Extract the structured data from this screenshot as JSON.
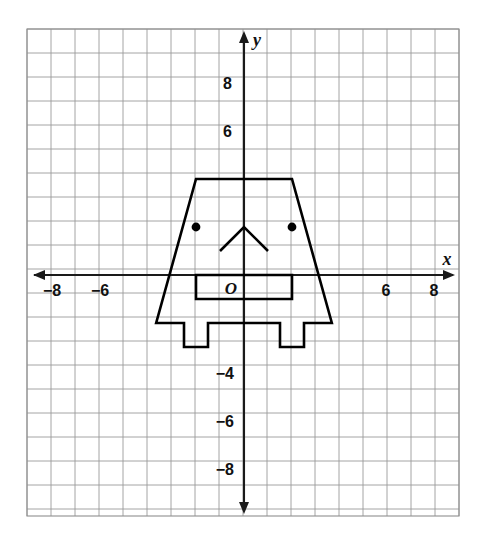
{
  "figure": {
    "kind": "coordinate-plane-figure",
    "background_color": "#ffffff",
    "grid_color": "#9a9a9a",
    "axis_color": "#1a1a1a",
    "shape_color": "#000000"
  },
  "axes": {
    "x_axis_label": "x",
    "y_axis_label": "y",
    "origin_label": "O",
    "x_range": [
      -9,
      9
    ],
    "y_range": [
      -10,
      10
    ],
    "unit_px": 24,
    "x_tick_labels": [
      {
        "text": "−8",
        "value": -8
      },
      {
        "text": "−6",
        "value": -6
      },
      {
        "text": "6",
        "value": 6
      },
      {
        "text": "8",
        "value": 8
      }
    ],
    "y_tick_labels": [
      {
        "text": "8",
        "value": 8
      },
      {
        "text": "6",
        "value": 6
      },
      {
        "text": "−4",
        "value": -4
      },
      {
        "text": "−6",
        "value": -6
      },
      {
        "text": "−8",
        "value": -8
      }
    ]
  },
  "chart_data": {
    "type": "scatter",
    "title": "",
    "xlabel": "x",
    "ylabel": "y",
    "xlim": [
      -9,
      9
    ],
    "ylim": [
      -10,
      10
    ],
    "grid": true,
    "legend": "none",
    "shapes": [
      {
        "name": "robot-body-outline",
        "closed": true,
        "points": [
          [
            -2,
            4
          ],
          [
            2,
            4
          ],
          [
            3.66,
            -2
          ],
          [
            2.5,
            -2
          ],
          [
            2.5,
            -3
          ],
          [
            1.5,
            -3
          ],
          [
            1.5,
            -2
          ],
          [
            -1.5,
            -2
          ],
          [
            -1.5,
            -3
          ],
          [
            -2.5,
            -3
          ],
          [
            -2.5,
            -2
          ],
          [
            -3.66,
            -2
          ]
        ]
      },
      {
        "name": "mouth-rectangle",
        "closed": true,
        "points": [
          [
            -2,
            0
          ],
          [
            2,
            0
          ],
          [
            2,
            -1
          ],
          [
            -2,
            -1
          ]
        ]
      },
      {
        "name": "nose-chevron",
        "closed": false,
        "points": [
          [
            -1,
            1
          ],
          [
            0,
            2
          ],
          [
            1,
            1
          ]
        ]
      }
    ],
    "points": [
      {
        "name": "left-eye",
        "x": -2,
        "y": 2
      },
      {
        "name": "right-eye",
        "x": 2,
        "y": 2
      }
    ]
  }
}
